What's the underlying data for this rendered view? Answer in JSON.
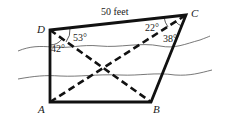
{
  "diagram": {
    "type": "quadrilateral-with-diagonals",
    "vertices": {
      "A": {
        "label": "A",
        "x": 50,
        "y": 102
      },
      "B": {
        "label": "B",
        "x": 151,
        "y": 102
      },
      "C": {
        "label": "C",
        "x": 186,
        "y": 15
      },
      "D": {
        "label": "D",
        "x": 50,
        "y": 30
      }
    },
    "side_label": "50 feet",
    "angles": {
      "D_upper": "53°",
      "D_lower": "42°",
      "C_upper": "22°",
      "C_lower": "38°"
    },
    "colors": {
      "stroke": "#111111",
      "river": "#555555"
    }
  }
}
